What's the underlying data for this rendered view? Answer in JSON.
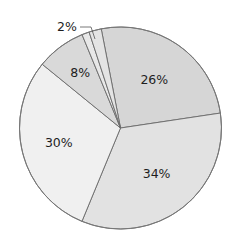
{
  "chart_data": {
    "type": "pie",
    "title": "",
    "labels": [
      "26%",
      "34%",
      "30%",
      "8%",
      "",
      "2%"
    ],
    "values": [
      26,
      34,
      30,
      8,
      1.2,
      2
    ],
    "colors": [
      "#d6d6d6",
      "#e2e2e2",
      "#f0f0f0",
      "#d9d9d9",
      "#e8e8e8",
      "#e4e4e4"
    ],
    "start_angle_deg_from_top": -11,
    "direction": "clockwise",
    "legend": null,
    "annotations": [
      {
        "text": "2%",
        "leader_line": true
      }
    ]
  }
}
